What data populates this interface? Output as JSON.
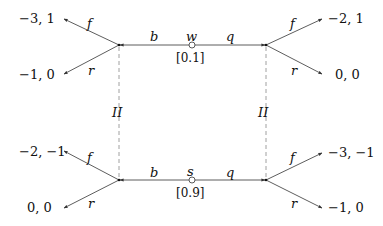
{
  "diagram": {
    "type": "signaling-game-tree",
    "nature_nodes": [
      {
        "id": "w",
        "label": "w",
        "prob": "[0.1]"
      },
      {
        "id": "s",
        "label": "s",
        "prob": "[0.9]"
      }
    ],
    "sender_actions": {
      "left": "b",
      "right": "q"
    },
    "receiver_actions": {
      "up": "f",
      "down": "r"
    },
    "info_sets": {
      "left": "II",
      "right": "II"
    },
    "payoffs": {
      "top_left_f": "−3, 1",
      "top_left_r": "−1, 0",
      "top_right_f": "−2, 1",
      "top_right_r": "0, 0",
      "bottom_left_f": "−2, −1",
      "bottom_left_r": "0, 0",
      "bottom_right_f": "−3, −1",
      "bottom_right_r": "−1, 0"
    },
    "colors": {
      "line": "#333333",
      "dashed": "#888888",
      "text": "#111111"
    }
  }
}
